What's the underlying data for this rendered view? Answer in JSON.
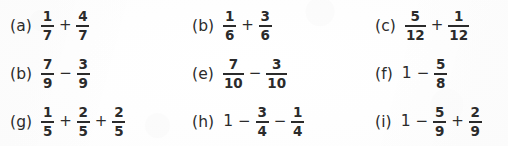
{
  "page": {
    "background_color": "#fdfdfd",
    "text_color": "#2b2b2b",
    "kind": "fraction-exercise-worksheet"
  },
  "rows": [
    {
      "items": [
        {
          "label": "(a)",
          "terms": [
            {
              "type": "fraction",
              "numerator": "1",
              "denominator": "7"
            },
            {
              "type": "operator",
              "symbol": "+"
            },
            {
              "type": "fraction",
              "numerator": "4",
              "denominator": "7"
            }
          ]
        },
        {
          "label": "(b)",
          "terms": [
            {
              "type": "fraction",
              "numerator": "1",
              "denominator": "6"
            },
            {
              "type": "operator",
              "symbol": "+"
            },
            {
              "type": "fraction",
              "numerator": "3",
              "denominator": "6"
            }
          ]
        },
        {
          "label": "(c)",
          "terms": [
            {
              "type": "fraction",
              "numerator": "5",
              "denominator": "12"
            },
            {
              "type": "operator",
              "symbol": "+"
            },
            {
              "type": "fraction",
              "numerator": "1",
              "denominator": "12"
            }
          ]
        }
      ]
    },
    {
      "items": [
        {
          "label": "(b)",
          "terms": [
            {
              "type": "fraction",
              "numerator": "7",
              "denominator": "9"
            },
            {
              "type": "operator",
              "symbol": "−"
            },
            {
              "type": "fraction",
              "numerator": "3",
              "denominator": "9"
            }
          ]
        },
        {
          "label": "(e)",
          "terms": [
            {
              "type": "fraction",
              "numerator": "7",
              "denominator": "10"
            },
            {
              "type": "operator",
              "symbol": "−"
            },
            {
              "type": "fraction",
              "numerator": "3",
              "denominator": "10"
            }
          ]
        },
        {
          "label": "(f)",
          "terms": [
            {
              "type": "whole",
              "value": "1"
            },
            {
              "type": "operator",
              "symbol": "−"
            },
            {
              "type": "fraction",
              "numerator": "5",
              "denominator": "8"
            }
          ]
        }
      ]
    },
    {
      "items": [
        {
          "label": "(g)",
          "terms": [
            {
              "type": "fraction",
              "numerator": "1",
              "denominator": "5"
            },
            {
              "type": "operator",
              "symbol": "+"
            },
            {
              "type": "fraction",
              "numerator": "2",
              "denominator": "5"
            },
            {
              "type": "operator",
              "symbol": "+"
            },
            {
              "type": "fraction",
              "numerator": "2",
              "denominator": "5"
            }
          ]
        },
        {
          "label": "(h)",
          "terms": [
            {
              "type": "whole",
              "value": "1"
            },
            {
              "type": "operator",
              "symbol": "−"
            },
            {
              "type": "fraction",
              "numerator": "3",
              "denominator": "4"
            },
            {
              "type": "operator",
              "symbol": "−"
            },
            {
              "type": "fraction",
              "numerator": "1",
              "denominator": "4"
            }
          ]
        },
        {
          "label": "(i)",
          "terms": [
            {
              "type": "whole",
              "value": "1"
            },
            {
              "type": "operator",
              "symbol": "−"
            },
            {
              "type": "fraction",
              "numerator": "5",
              "denominator": "9"
            },
            {
              "type": "operator",
              "symbol": "+"
            },
            {
              "type": "fraction",
              "numerator": "2",
              "denominator": "9"
            }
          ]
        }
      ]
    }
  ]
}
